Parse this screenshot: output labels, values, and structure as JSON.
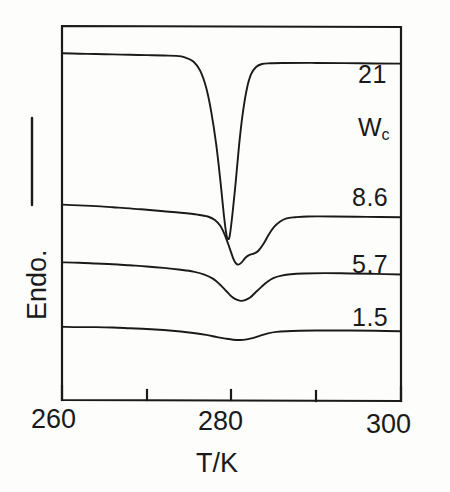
{
  "figure": {
    "background_color": "#fdfdfc",
    "ink_color": "#1a1a1a"
  },
  "axes": {
    "x_title": "T/K",
    "y_title": "Endo.",
    "y_arrow": "up-arrow-endothermic",
    "x_tick_labels": [
      "260",
      "280",
      "300"
    ],
    "x_minor_ticks": [
      "270",
      "290"
    ]
  },
  "curve_labels": {
    "legend_title_main": "W",
    "legend_title_sub": "c",
    "c21": "21",
    "c86": "8.6",
    "c57": "5.7",
    "c15": "1.5"
  },
  "chart_data": {
    "type": "line",
    "title": "",
    "subtitle": "",
    "xlabel": "T/K",
    "ylabel": "Endo.",
    "xlim": [
      260,
      300
    ],
    "ylim": [
      0,
      1
    ],
    "grid": false,
    "legend_position": "right-inside",
    "legend_title": "Wc",
    "axis_note": "Vertical axis is arbitrary heat-flow units; arrow indicates endothermic direction (upward). Curves are vertically offset from one another.",
    "x_major_ticks": [
      260,
      280,
      300
    ],
    "x_minor_ticks": [
      270,
      290
    ],
    "series": [
      {
        "name": "21",
        "label": "21",
        "peak_minimum_T": 279.5,
        "peak_character": "very sharp deep narrow endotherm",
        "baseline_left_y": 0.937,
        "baseline_right_y": 0.91,
        "peak_depth_rel": 0.5,
        "points_xy": [
          [
            260.0,
            0.937
          ],
          [
            262.0,
            0.936
          ],
          [
            264.0,
            0.935
          ],
          [
            266.0,
            0.934
          ],
          [
            268.0,
            0.933
          ],
          [
            270.0,
            0.932
          ],
          [
            272.0,
            0.931
          ],
          [
            273.5,
            0.93
          ],
          [
            274.5,
            0.926
          ],
          [
            275.5,
            0.915
          ],
          [
            276.3,
            0.89
          ],
          [
            277.0,
            0.845
          ],
          [
            277.6,
            0.78
          ],
          [
            278.2,
            0.69
          ],
          [
            278.7,
            0.59
          ],
          [
            279.1,
            0.5
          ],
          [
            279.4,
            0.447
          ],
          [
            279.6,
            0.435
          ],
          [
            279.8,
            0.445
          ],
          [
            280.1,
            0.5
          ],
          [
            280.5,
            0.59
          ],
          [
            280.9,
            0.69
          ],
          [
            281.3,
            0.77
          ],
          [
            281.8,
            0.84
          ],
          [
            282.3,
            0.88
          ],
          [
            282.9,
            0.9
          ],
          [
            283.6,
            0.908
          ],
          [
            284.6,
            0.91
          ],
          [
            286.0,
            0.911
          ],
          [
            290.0,
            0.911
          ],
          [
            295.0,
            0.91
          ],
          [
            300.0,
            0.909
          ]
        ]
      },
      {
        "name": "8.6",
        "label": "8.6",
        "peak_minimum_T": 280.4,
        "peak_character": "broad endotherm with high-temperature shoulder",
        "baseline_left_y": 0.528,
        "baseline_right_y": 0.495,
        "peak_depth_rel": 0.345,
        "points_xy": [
          [
            260.0,
            0.528
          ],
          [
            262.0,
            0.526
          ],
          [
            264.0,
            0.524
          ],
          [
            266.0,
            0.521
          ],
          [
            268.0,
            0.518
          ],
          [
            270.0,
            0.514
          ],
          [
            272.0,
            0.51
          ],
          [
            274.0,
            0.506
          ],
          [
            276.0,
            0.501
          ],
          [
            277.2,
            0.496
          ],
          [
            278.0,
            0.487
          ],
          [
            278.7,
            0.47
          ],
          [
            279.3,
            0.441
          ],
          [
            279.8,
            0.409
          ],
          [
            280.2,
            0.383
          ],
          [
            280.5,
            0.37
          ],
          [
            280.8,
            0.366
          ],
          [
            281.2,
            0.372
          ],
          [
            281.7,
            0.386
          ],
          [
            282.2,
            0.393
          ],
          [
            282.7,
            0.396
          ],
          [
            283.2,
            0.404
          ],
          [
            283.8,
            0.423
          ],
          [
            284.4,
            0.447
          ],
          [
            285.0,
            0.467
          ],
          [
            285.7,
            0.482
          ],
          [
            286.5,
            0.491
          ],
          [
            287.5,
            0.494
          ],
          [
            289.0,
            0.496
          ],
          [
            292.0,
            0.496
          ],
          [
            296.0,
            0.495
          ],
          [
            300.0,
            0.494
          ]
        ]
      },
      {
        "name": "5.7",
        "label": "5.7",
        "peak_minimum_T": 280.8,
        "peak_character": "broad shallow endotherm",
        "baseline_left_y": 0.372,
        "baseline_right_y": 0.34,
        "peak_depth_rel": 0.225,
        "points_xy": [
          [
            260.0,
            0.372
          ],
          [
            262.0,
            0.371
          ],
          [
            264.0,
            0.369
          ],
          [
            266.0,
            0.367
          ],
          [
            268.0,
            0.364
          ],
          [
            270.0,
            0.361
          ],
          [
            272.0,
            0.357
          ],
          [
            274.0,
            0.352
          ],
          [
            275.5,
            0.347
          ],
          [
            276.8,
            0.339
          ],
          [
            277.8,
            0.328
          ],
          [
            278.6,
            0.313
          ],
          [
            279.4,
            0.294
          ],
          [
            280.0,
            0.28
          ],
          [
            280.6,
            0.271
          ],
          [
            281.1,
            0.268
          ],
          [
            281.6,
            0.27
          ],
          [
            282.2,
            0.277
          ],
          [
            282.8,
            0.29
          ],
          [
            283.5,
            0.305
          ],
          [
            284.2,
            0.319
          ],
          [
            285.0,
            0.33
          ],
          [
            285.9,
            0.336
          ],
          [
            287.0,
            0.34
          ],
          [
            288.5,
            0.342
          ],
          [
            291.0,
            0.343
          ],
          [
            294.0,
            0.342
          ],
          [
            297.0,
            0.341
          ],
          [
            300.0,
            0.339
          ]
        ]
      },
      {
        "name": "1.5",
        "label": "1.5",
        "peak_minimum_T": 280.6,
        "peak_character": "very shallow broad endotherm",
        "baseline_left_y": 0.198,
        "baseline_right_y": 0.186,
        "peak_depth_rel": 0.073,
        "points_xy": [
          [
            260.0,
            0.198
          ],
          [
            262.0,
            0.197
          ],
          [
            264.0,
            0.197
          ],
          [
            266.0,
            0.196
          ],
          [
            268.0,
            0.194
          ],
          [
            270.0,
            0.192
          ],
          [
            272.0,
            0.189
          ],
          [
            274.0,
            0.185
          ],
          [
            275.5,
            0.181
          ],
          [
            277.0,
            0.176
          ],
          [
            278.3,
            0.17
          ],
          [
            279.3,
            0.166
          ],
          [
            280.2,
            0.163
          ],
          [
            281.0,
            0.162
          ],
          [
            281.8,
            0.164
          ],
          [
            282.6,
            0.168
          ],
          [
            283.4,
            0.174
          ],
          [
            284.3,
            0.18
          ],
          [
            285.3,
            0.184
          ],
          [
            286.5,
            0.186
          ],
          [
            288.0,
            0.187
          ],
          [
            291.0,
            0.188
          ],
          [
            294.0,
            0.188
          ],
          [
            297.0,
            0.187
          ],
          [
            300.0,
            0.186
          ]
        ]
      }
    ]
  }
}
